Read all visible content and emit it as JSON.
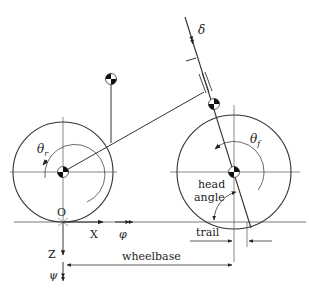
{
  "diagram": {
    "labels": {
      "delta": "δ",
      "theta_r": "θ",
      "theta_r_sub": "r",
      "theta_f": "θ",
      "theta_f_sub": "f",
      "origin": "O",
      "x_axis": "X",
      "z_axis": "Z",
      "phi": "φ",
      "psi": "ψ",
      "head_angle_line1": "head",
      "head_angle_line2": "angle",
      "trail": "trail",
      "wheelbase": "wheelbase"
    },
    "components": [
      {
        "name": "rear-wheel",
        "center": [
          63,
          172
        ],
        "radius": 50
      },
      {
        "name": "front-wheel",
        "center": [
          234,
          172
        ],
        "radius": 57
      },
      {
        "name": "rear-frame-cg",
        "center": [
          111,
          79
        ]
      },
      {
        "name": "front-frame-cg",
        "center": [
          214,
          104
        ]
      },
      {
        "name": "rear-hub-cg",
        "center": [
          63,
          172
        ]
      },
      {
        "name": "front-hub-cg",
        "center": [
          234,
          172
        ]
      }
    ],
    "colors": {
      "line": "#333333",
      "mass_dark": "#111111",
      "background": "#ffffff"
    }
  }
}
